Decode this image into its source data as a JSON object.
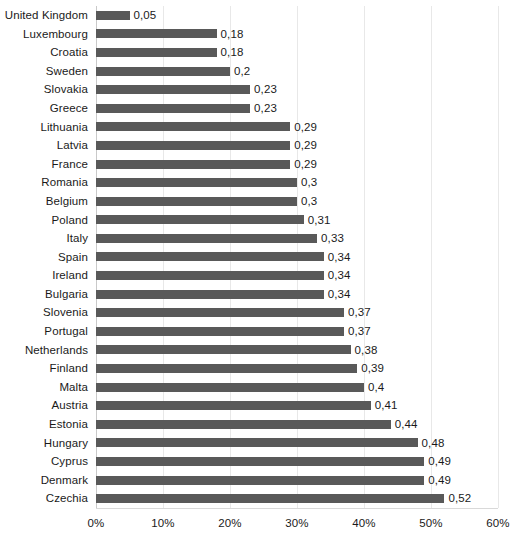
{
  "chart_data": {
    "type": "bar",
    "orientation": "horizontal",
    "title": "",
    "subtitle": "",
    "xlabel": "",
    "ylabel": "",
    "xlim": [
      0,
      60
    ],
    "grid": true,
    "legend": null,
    "value_axis_unit": "%",
    "value_label_decimal_separator": ",",
    "xtick_labels": [
      "0%",
      "10%",
      "20%",
      "30%",
      "40%",
      "50%",
      "60%"
    ],
    "xtick_values": [
      0,
      10,
      20,
      30,
      40,
      50,
      60
    ],
    "categories": [
      "United Kingdom",
      "Luxembourg",
      "Croatia",
      "Sweden",
      "Slovakia",
      "Greece",
      "Lithuania",
      "Latvia",
      "France",
      "Romania",
      "Belgium",
      "Poland",
      "Italy",
      "Spain",
      "Ireland",
      "Bulgaria",
      "Slovenia",
      "Portugal",
      "Netherlands",
      "Finland",
      "Malta",
      "Austria",
      "Estonia",
      "Hungary",
      "Cyprus",
      "Denmark",
      "Czechia"
    ],
    "values": [
      0.05,
      0.18,
      0.18,
      0.2,
      0.23,
      0.23,
      0.29,
      0.29,
      0.29,
      0.3,
      0.3,
      0.31,
      0.33,
      0.34,
      0.34,
      0.34,
      0.37,
      0.37,
      0.38,
      0.39,
      0.4,
      0.41,
      0.44,
      0.48,
      0.49,
      0.49,
      0.52
    ],
    "data_labels": [
      "0,05",
      "0,18",
      "0,18",
      "0,2",
      "0,23",
      "0,23",
      "0,29",
      "0,29",
      "0,29",
      "0,3",
      "0,3",
      "0,31",
      "0,33",
      "0,34",
      "0,34",
      "0,34",
      "0,37",
      "0,37",
      "0,38",
      "0,39",
      "0,4",
      "0,41",
      "0,44",
      "0,48",
      "0,49",
      "0,49",
      "0,52"
    ],
    "colors": {
      "bar": "#595959",
      "gridline": "#e8e8e8",
      "axis": "#c9c9c9",
      "text": "#1a1a1a",
      "background": "#ffffff"
    }
  }
}
